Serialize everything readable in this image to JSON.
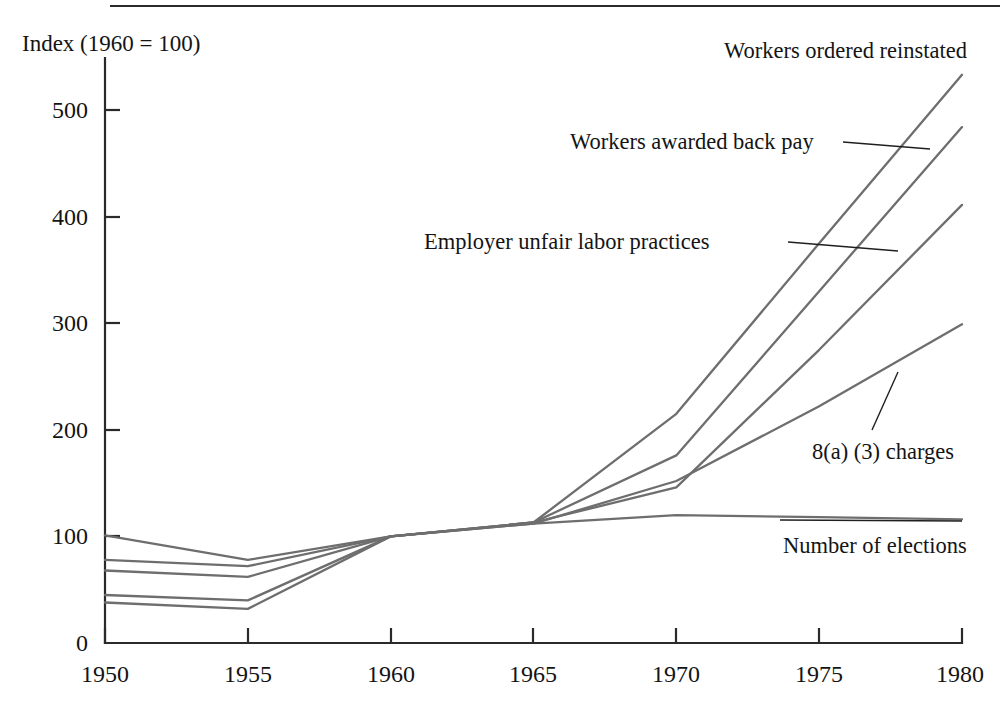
{
  "figure": {
    "background_color": "#ffffff",
    "line_color": "#6e6e6e",
    "axis_color": "#2a2a2a",
    "text_color": "#141414",
    "has_top_rule": true
  },
  "axis": {
    "y_title": "Index (1960 = 100)",
    "y_ticks": [
      "500",
      "400",
      "300",
      "200",
      "100",
      "0"
    ],
    "x_ticks": [
      "1950",
      "1955",
      "1960",
      "1965",
      "1970",
      "1975",
      "1980"
    ]
  },
  "annotations": {
    "workers_ordered_reinstated": "Workers ordered reinstated",
    "workers_awarded_back_pay": "Workers awarded back pay",
    "employer_unfair_labor_practices": "Employer unfair labor practices",
    "charges_8a3": "8(a) (3) charges",
    "number_of_elections": "Number of elections"
  },
  "chart_data": {
    "type": "line",
    "title": "",
    "xlabel": "",
    "ylabel": "Index (1960 = 100)",
    "x": [
      1950,
      1955,
      1960,
      1965,
      1970,
      1975,
      1980
    ],
    "xlim": [
      1950,
      1980
    ],
    "ylim": [
      0,
      560
    ],
    "yticks": [
      0,
      100,
      200,
      300,
      400,
      500
    ],
    "xticks": [
      1950,
      1955,
      1960,
      1965,
      1970,
      1975,
      1980
    ],
    "grid": false,
    "legend": "inline-annotations",
    "series": [
      {
        "name": "Workers ordered reinstated",
        "values": [
          38,
          32,
          100,
          113,
          215,
          375,
          533
        ]
      },
      {
        "name": "Workers awarded back pay",
        "values": [
          45,
          40,
          100,
          113,
          176,
          330,
          484
        ]
      },
      {
        "name": "Employer unfair labor practices",
        "values": [
          68,
          62,
          100,
          113,
          146,
          275,
          411
        ]
      },
      {
        "name": "8(a) (3) charges",
        "values": [
          78,
          72,
          100,
          112,
          152,
          222,
          299
        ]
      },
      {
        "name": "Number of elections",
        "values": [
          101,
          78,
          100,
          112,
          120,
          118,
          116
        ]
      }
    ]
  }
}
